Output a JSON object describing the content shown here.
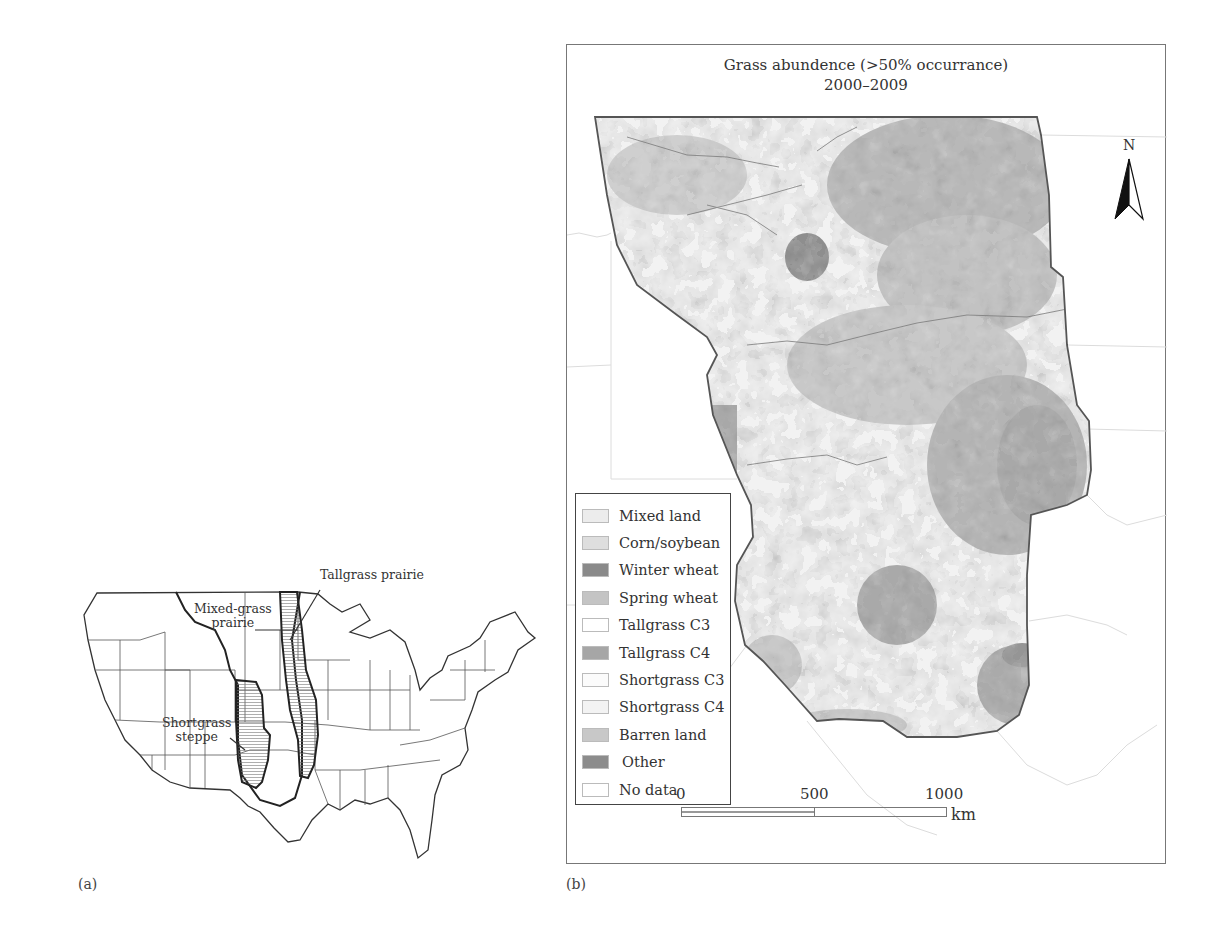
{
  "figure": {
    "panel_a": {
      "letter": "(a)",
      "labels": {
        "tallgrass": "Tallgrass prairie",
        "mixedgrass_line1": "Mixed-grass",
        "mixedgrass_line2": "prairie",
        "shortgrass_line1": "Shortgrass",
        "shortgrass_line2": "steppe"
      }
    },
    "panel_b": {
      "letter": "(b)",
      "title_line1": "Grass abundence (>50% occurrance)",
      "title_line2": "2000–2009",
      "north_label": "N",
      "legend": [
        {
          "label": "Mixed land",
          "color": "#ececec"
        },
        {
          "label": "Corn/soybean",
          "color": "#dedede"
        },
        {
          "label": "Winter wheat",
          "color": "#8a8a8a"
        },
        {
          "label": "Spring wheat",
          "color": "#c4c4c4"
        },
        {
          "label": "Tallgrass C3",
          "color": "#ffffff"
        },
        {
          "label": "Tallgrass C4",
          "color": "#a6a6a6"
        },
        {
          "label": "Shortgrass C3",
          "color": "#fbfbfb"
        },
        {
          "label": "Shortgrass C4",
          "color": "#f3f3f3"
        },
        {
          "label": "Barren land",
          "color": "#c8c8c8"
        },
        {
          "label": "Other",
          "color": "#8c8c8c"
        },
        {
          "label": "No data",
          "color": "#ffffff"
        }
      ],
      "scale": {
        "ticks": [
          "0",
          "500",
          "1000"
        ],
        "unit": "km"
      }
    }
  }
}
